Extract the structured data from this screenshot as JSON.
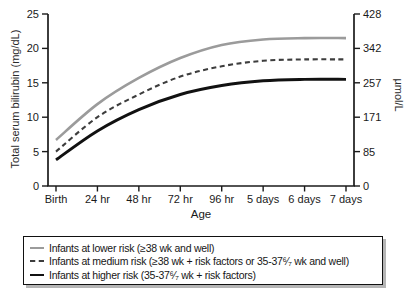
{
  "figure": {
    "background": "#ffffff",
    "axis_color": "#1a1a1a"
  },
  "chart_data": {
    "type": "line",
    "title": "",
    "xlabel": "Age",
    "ylabel_left": "Total serum bilirubin (mg/dL)",
    "ylabel_right": "µmol/L",
    "categories": [
      "Birth",
      "24 hr",
      "48 hr",
      "72 hr",
      "96 hr",
      "5 days",
      "6 days",
      "7 days"
    ],
    "y_left": {
      "range": [
        0,
        25
      ],
      "tick_values": [
        0,
        5,
        10,
        15,
        20,
        25
      ],
      "tick_labels": [
        "0",
        "5",
        "10",
        "15",
        "20",
        "25"
      ]
    },
    "y_right": {
      "tick_labels": [
        "0",
        "85",
        "171",
        "257",
        "342",
        "428"
      ]
    },
    "grid": false,
    "legend_position": "bottom-box",
    "series": [
      {
        "name": "lower-risk",
        "label": "Infants at lower risk (≥38 wk and well)",
        "color": "#9b9b9b",
        "dash": null,
        "width": 2.6,
        "values": [
          6.7,
          11.9,
          15.7,
          18.6,
          20.5,
          21.3,
          21.5,
          21.5
        ]
      },
      {
        "name": "medium-risk",
        "label": "Infants at medium risk (≥38 wk + risk factors or 35-37⁶⁄₇ wk and well)",
        "color": "#3d3d3d",
        "dash": "5 3.5",
        "width": 2.1,
        "values": [
          5.0,
          10.0,
          13.3,
          15.9,
          17.4,
          18.2,
          18.4,
          18.4
        ]
      },
      {
        "name": "higher-risk",
        "label": "Infants at higher risk (35-37⁶⁄₇ wk + risk factors)",
        "color": "#111111",
        "dash": null,
        "width": 2.9,
        "values": [
          3.8,
          8.0,
          11.1,
          13.3,
          14.6,
          15.3,
          15.5,
          15.5
        ]
      }
    ]
  }
}
